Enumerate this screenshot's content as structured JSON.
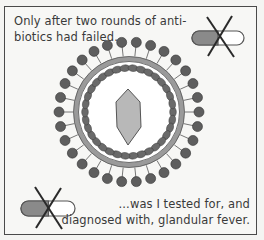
{
  "caption_top": {
    "line1": "Only after two rounds of anti-",
    "line2": "biotics had failed..."
  },
  "caption_bottom": {
    "line1": "...was I tested for, and",
    "line2": "diagnosed with, glandular fever."
  },
  "illustration": {
    "subject": "virus-particle",
    "icons": [
      "crossed-out-pill-icon",
      "crossed-out-pill-icon",
      "virus-icon"
    ]
  },
  "colors": {
    "ink": "#3a3a3a",
    "spike": "#5e5e5e",
    "membrane": "#9a9a9a",
    "capsid": "#b8b8b8",
    "background": "#f7f7f5"
  }
}
